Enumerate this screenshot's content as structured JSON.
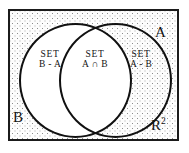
{
  "figure": {
    "type": "venn-diagram",
    "colors": {
      "stroke": "#111111",
      "frame_border": "#1b1b1b",
      "shaded_background": "#fdfdfd",
      "stipple_dots": "#8d8d8d",
      "circle_fill": "#ffffff",
      "text": "#141414"
    }
  },
  "universe": {
    "label": "R",
    "exponent": "2",
    "shading": "stippled-dots"
  },
  "sets": {
    "a_label": "A",
    "b_label": "B"
  },
  "regions": [
    {
      "name": "b-minus-a",
      "line1": "SET",
      "line2": "B - A"
    },
    {
      "name": "a-intersect-b",
      "line1": "SET",
      "line2": "A ∩ B"
    },
    {
      "name": "a-minus-b",
      "line1": "SET",
      "line2": "A - B"
    }
  ]
}
